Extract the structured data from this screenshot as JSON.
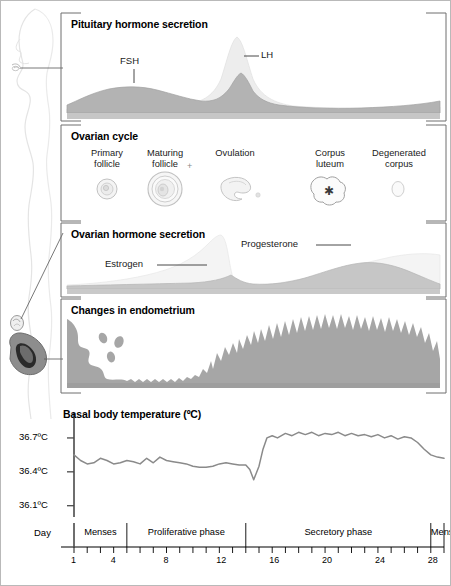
{
  "figure": {
    "colors": {
      "fsh_fill": "#b4b4b4",
      "lh_fill": "#ececec",
      "estrogen_fill": "#f2f2f2",
      "progesterone_fill": "#c9c9c9",
      "endometrium_fill": "#a6a6a6",
      "body_outline": "#e6e6e6",
      "uterus_fill": "#8f8f8f",
      "line": "#7a7a7a",
      "frame": "#6e6e6e",
      "text": "#000000"
    }
  },
  "anatomy": {
    "body_outline_name": "female-body-silhouette",
    "pituitary_name": "pituitary-gland",
    "ovary_name": "ovary",
    "uterus_name": "uterus"
  },
  "panels": {
    "pituitary": {
      "title": "Pituitary hormone secretion",
      "curves": [
        {
          "name": "FSH",
          "label": "FSH"
        },
        {
          "name": "LH",
          "label": "LH"
        }
      ]
    },
    "ovarian_cycle": {
      "title": "Ovarian cycle",
      "stages": [
        {
          "label_line1": "Primary",
          "label_line2": "follicle",
          "icon": "primary-follicle-icon"
        },
        {
          "label_line1": "Maturing",
          "label_line2": "follicle",
          "icon": "maturing-follicle-icon"
        },
        {
          "label_line1": "Ovulation",
          "label_line2": "",
          "icon": "ovulation-icon"
        },
        {
          "label_line1": "Corpus",
          "label_line2": "luteum",
          "icon": "corpus-luteum-icon"
        },
        {
          "label_line1": "Degenerated",
          "label_line2": "corpus",
          "icon": "degenerated-corpus-icon"
        }
      ]
    },
    "ovarian_hormones": {
      "title": "Ovarian hormone secretion",
      "curves": [
        {
          "name": "Estrogen",
          "label": "Estrogen"
        },
        {
          "name": "Progesterone",
          "label": "Progesterone"
        }
      ]
    },
    "endometrium": {
      "title": "Changes in endometrium"
    },
    "temperature": {
      "title": "Basal body temperature (ºC)"
    }
  },
  "chart_data": {
    "type": "line",
    "title": "Basal body temperature (ºC)",
    "xlabel": "Day",
    "ylabel": "ºC",
    "ylim": [
      36.0,
      36.85
    ],
    "yticks": [
      36.7,
      36.4,
      36.1
    ],
    "ytick_labels": [
      "36.7ºC",
      "36.4ºC",
      "36.1ºC"
    ],
    "xlim": [
      1,
      29
    ],
    "xticks": [
      1,
      2,
      3,
      4,
      5,
      6,
      7,
      8,
      9,
      10,
      11,
      12,
      13,
      14,
      15,
      16,
      17,
      18,
      19,
      20,
      21,
      22,
      23,
      24,
      25,
      26,
      27,
      28,
      29
    ],
    "xtick_labels": [
      "1",
      "4",
      "8",
      "12",
      "16",
      "20",
      "24",
      "28"
    ],
    "xtick_label_days": [
      1,
      4,
      8,
      12,
      16,
      20,
      24,
      28
    ],
    "grid": false,
    "legend": "none",
    "x": [
      1,
      1.5,
      2,
      2.5,
      3,
      3.5,
      4,
      4.5,
      5,
      5.5,
      6,
      6.5,
      7,
      7.5,
      8,
      8.5,
      9,
      9.5,
      10,
      10.5,
      11,
      11.5,
      12,
      12.5,
      13,
      13.5,
      14,
      14.3,
      14.6,
      15,
      15.3,
      15.6,
      16,
      16.4,
      17,
      17.5,
      18,
      18.5,
      19,
      19.5,
      20,
      20.5,
      21,
      21.5,
      22,
      22.5,
      23,
      23.5,
      24,
      24.5,
      25,
      25.5,
      26,
      26.5,
      27,
      27.5,
      28,
      28.5,
      29
    ],
    "y": [
      36.55,
      36.5,
      36.47,
      36.48,
      36.52,
      36.5,
      36.47,
      36.48,
      36.5,
      36.49,
      36.47,
      36.52,
      36.48,
      36.53,
      36.5,
      36.49,
      36.48,
      36.47,
      36.45,
      36.44,
      36.44,
      36.45,
      36.47,
      36.48,
      36.47,
      36.46,
      36.46,
      36.42,
      36.33,
      36.45,
      36.6,
      36.7,
      36.72,
      36.7,
      36.74,
      36.72,
      36.75,
      36.73,
      36.75,
      36.72,
      36.74,
      36.73,
      36.75,
      36.72,
      36.74,
      36.72,
      36.73,
      36.71,
      36.73,
      36.7,
      36.72,
      36.69,
      36.71,
      36.7,
      36.66,
      36.6,
      36.55,
      36.53,
      36.52
    ],
    "phases": [
      {
        "label": "Menses",
        "start_day": 1,
        "end_day": 5
      },
      {
        "label": "Proliferative phase",
        "start_day": 5,
        "end_day": 14
      },
      {
        "label": "Secretory phase",
        "start_day": 14,
        "end_day": 28
      },
      {
        "label": "Menses",
        "start_day": 28,
        "end_day": 29.8
      }
    ],
    "day_axis_label": "Day"
  }
}
